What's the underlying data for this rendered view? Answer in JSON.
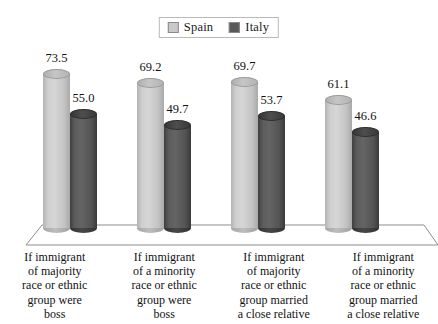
{
  "chart_data": {
    "type": "bar",
    "title": "",
    "subtitle": "",
    "xlabel": "",
    "ylabel": "",
    "ylim": [
      0,
      80
    ],
    "grid": false,
    "legend_position": "top-center",
    "style": "3d-cylinder",
    "categories": [
      "If immigrant of majority race or ethnic group were boss",
      "If immigrant of a minority race or ethnic group were boss",
      "If immigrant of majority race or ethnic group married a close relative",
      "If immigrant of a minority race or ethnic group married a close relative"
    ],
    "category_lines": [
      [
        "If immigrant",
        "of majority",
        "race or ethnic",
        "group were",
        "boss"
      ],
      [
        "If immigrant",
        "of a minority",
        "race or ethnic",
        "group were",
        "boss"
      ],
      [
        "If immigrant",
        "of majority",
        "race or ethnic",
        "group married",
        "a close relative"
      ],
      [
        "If immigrant",
        "of a minority",
        "race or ethnic",
        "group married",
        "a close relative"
      ]
    ],
    "series": [
      {
        "name": "Spain",
        "color": "#c9c9c9",
        "values": [
          73.5,
          69.2,
          69.7,
          61.1
        ],
        "labels": [
          "73.5",
          "69.2",
          "69.7",
          "61.1"
        ]
      },
      {
        "name": "Italy",
        "color": "#595959",
        "values": [
          55.0,
          49.7,
          53.7,
          46.6
        ],
        "labels": [
          "55.0",
          "49.7",
          "53.7",
          "46.6"
        ]
      }
    ]
  },
  "legend": {
    "items": [
      {
        "label": "Spain",
        "swatch": "spain-swatch-icon",
        "color": "#c9c9c9"
      },
      {
        "label": "Italy",
        "swatch": "italy-swatch-icon",
        "color": "#595959"
      }
    ]
  }
}
